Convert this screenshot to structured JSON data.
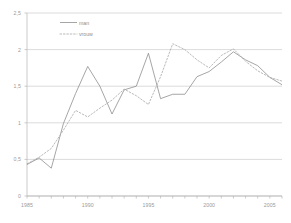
{
  "chart_data": {
    "type": "line",
    "title": "",
    "xlabel": "",
    "ylabel": "",
    "xlim": [
      1985,
      2006
    ],
    "ylim": [
      0,
      2.5
    ],
    "grid": true,
    "legend_position": "top-left",
    "decimal_separator": ",",
    "y_ticks": [
      "0",
      "0,5",
      "1",
      "1,5",
      "2",
      "2,5"
    ],
    "y_tick_values": [
      0,
      0.5,
      1,
      1.5,
      2,
      2.5
    ],
    "x_ticks": [
      "1985",
      "1990",
      "1995",
      "2000",
      "2005"
    ],
    "x_tick_values": [
      1985,
      1990,
      1995,
      2000,
      2005
    ],
    "x": [
      1985,
      1986,
      1987,
      1988,
      1989,
      1990,
      1991,
      1992,
      1993,
      1994,
      1995,
      1996,
      1997,
      1998,
      1999,
      2000,
      2001,
      2002,
      2003,
      2004,
      2005,
      2006
    ],
    "series": [
      {
        "name": "man",
        "style": "solid",
        "color": "#808080",
        "values": [
          0.43,
          0.52,
          0.38,
          0.99,
          1.4,
          1.77,
          1.5,
          1.12,
          1.45,
          1.5,
          1.95,
          1.33,
          1.39,
          1.39,
          1.63,
          1.7,
          1.83,
          1.97,
          1.86,
          1.78,
          1.62,
          1.52
        ]
      },
      {
        "name": "vrouw",
        "style": "dotted",
        "color": "#a8a8a8",
        "values": [
          0.44,
          0.53,
          0.65,
          0.9,
          1.17,
          1.08,
          1.2,
          1.31,
          1.46,
          1.37,
          1.25,
          1.63,
          2.08,
          2.0,
          1.86,
          1.75,
          1.92,
          2.01,
          1.84,
          1.71,
          1.62,
          1.57
        ]
      }
    ]
  },
  "legend": {
    "entries": [
      {
        "label": "man"
      },
      {
        "label": "vrouw"
      }
    ]
  }
}
